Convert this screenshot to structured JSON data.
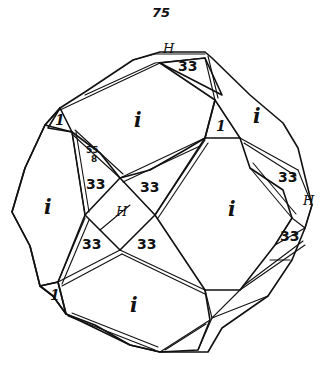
{
  "figure": {
    "number": "75",
    "bottom_caption_fragment": "~~",
    "labels": {
      "H_top": "H",
      "face_33_top": "33",
      "face_i_top_center": "i",
      "face_i_top_right": "i",
      "face_1_left": "1",
      "face_1_right": "1",
      "face_55": "55",
      "face_55_sub": "8",
      "face_33_left_upper": "33",
      "face_33_center_upper": "33",
      "face_i_left": "i",
      "face_H_center": "H",
      "face_i_right_center": "i",
      "face_33_right_upper": "33",
      "face_H_right": "H",
      "face_33_left_lower": "33",
      "face_33_center_lower": "33",
      "face_33_right_lower": "33",
      "face_1_bottom_left": "1",
      "face_i_bottom": "i"
    },
    "colors": {
      "ink": "#111111",
      "paper": "#ffffff"
    }
  }
}
